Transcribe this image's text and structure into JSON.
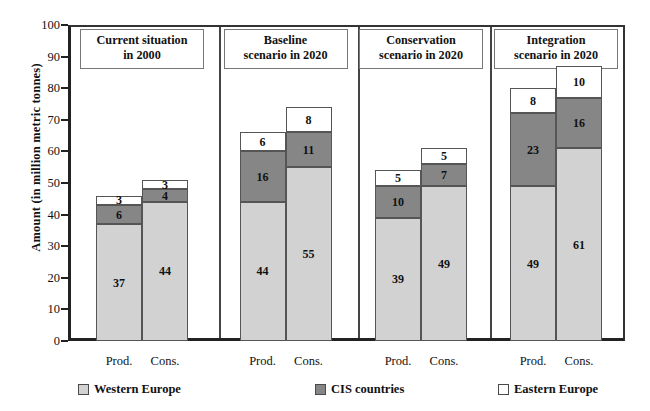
{
  "chart_data": {
    "type": "bar",
    "stacked": true,
    "title": "",
    "xlabel": "",
    "ylabel": "Amount (in million metric tonnes)",
    "ylim": [
      0,
      100
    ],
    "ytick_step": 10,
    "yticks": [
      100,
      90,
      80,
      70,
      60,
      50,
      40,
      30,
      20,
      10,
      0
    ],
    "grid": false,
    "legend_position": "bottom",
    "series": [
      {
        "name": "Western Europe",
        "color": "#d2d2d2"
      },
      {
        "name": "CIS countries",
        "color": "#868686"
      },
      {
        "name": "Eastern Europe",
        "color": "#ffffff"
      }
    ],
    "panels": [
      {
        "title_line1": "Current   situation",
        "title_line2": "in 2000",
        "categories": [
          "Prod.",
          "Cons."
        ],
        "bars": [
          {
            "category": "Prod.",
            "values": [
              37,
              6,
              3
            ],
            "total": 46
          },
          {
            "category": "Cons.",
            "values": [
              44,
              4,
              3
            ],
            "total": 51
          }
        ]
      },
      {
        "title_line1": "Baseline",
        "title_line2": "scenario in 2020",
        "categories": [
          "Prod.",
          "Cons."
        ],
        "bars": [
          {
            "category": "Prod.",
            "values": [
              44,
              16,
              6
            ],
            "total": 66
          },
          {
            "category": "Cons.",
            "values": [
              55,
              11,
              8
            ],
            "total": 74
          }
        ]
      },
      {
        "title_line1": "Conservation",
        "title_line2": "scenario in 2020",
        "categories": [
          "Prod.",
          "Cons."
        ],
        "bars": [
          {
            "category": "Prod.",
            "values": [
              39,
              10,
              5
            ],
            "total": 54
          },
          {
            "category": "Cons.",
            "values": [
              49,
              7,
              5
            ],
            "total": 61
          }
        ]
      },
      {
        "title_line1": "Integration",
        "title_line2": "scenario in 2020",
        "categories": [
          "Prod.",
          "Cons."
        ],
        "bars": [
          {
            "category": "Prod.",
            "values": [
              49,
              23,
              8
            ],
            "total": 80
          },
          {
            "category": "Cons.",
            "values": [
              61,
              16,
              10
            ],
            "total": 87
          }
        ]
      }
    ]
  }
}
